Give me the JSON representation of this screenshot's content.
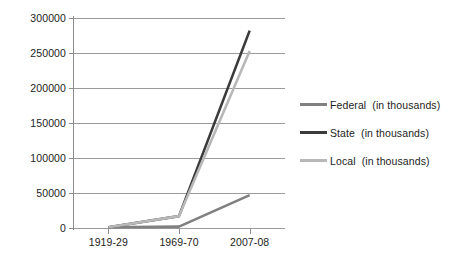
{
  "chart_data": {
    "type": "line",
    "title": "",
    "xlabel": "",
    "ylabel": "",
    "categories": [
      "1919-29",
      "1969-70",
      "2007-08"
    ],
    "series": [
      {
        "name": "Federal  (in thousands)",
        "short_name": "Federal",
        "color": "#808080",
        "values": [
          1000,
          2000,
          47000
        ]
      },
      {
        "name": "State  (in thousands)",
        "short_name": "State",
        "color": "#3b3b3b",
        "values": [
          1000,
          17000,
          282000
        ]
      },
      {
        "name": "Local  (in thousands)",
        "short_name": "Local",
        "color": "#b8b8b8",
        "values": [
          1000,
          17000,
          253000
        ]
      }
    ],
    "ylim": [
      0,
      300000
    ],
    "yticks": [
      0,
      50000,
      100000,
      150000,
      200000,
      250000,
      300000
    ],
    "ytick_labels": [
      "0",
      "50000",
      "100000",
      "150000",
      "200000",
      "250000",
      "300000"
    ],
    "grid": true,
    "legend_position": "right",
    "gridline_color": "#9b9b9b",
    "axis_color": "#8c8c8c",
    "background": "#ffffff"
  }
}
